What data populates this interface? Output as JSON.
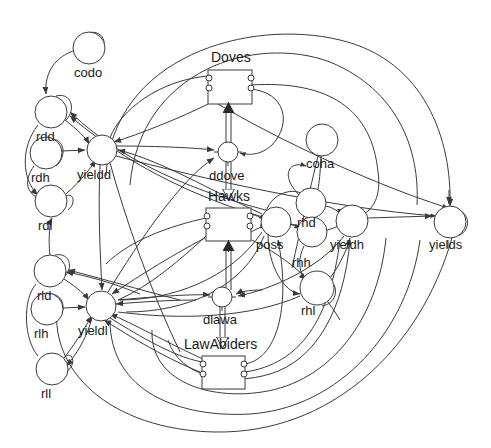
{
  "diagram": {
    "type": "system-dynamics-stock-and-flow",
    "title": "",
    "colors": {
      "stroke": "#3a3a3a",
      "text": "#1a1a1a",
      "background": "#ffffff",
      "flow_fill": "#ffffff"
    },
    "stocks": [
      {
        "id": "Doves",
        "label": "Doves",
        "x": 208,
        "y": 70,
        "w": 44,
        "h": 34,
        "label_x": 211,
        "label_y": 58
      },
      {
        "id": "Hawks",
        "label": "Hawks",
        "x": 206,
        "y": 208,
        "w": 45,
        "h": 33,
        "label_x": 208,
        "label_y": 197
      },
      {
        "id": "LawAbiders",
        "label": "LawAbiders",
        "x": 202,
        "y": 356,
        "w": 43,
        "h": 33,
        "label_x": 184,
        "label_y": 345
      }
    ],
    "flows": [
      {
        "id": "ddove",
        "label": "ddove",
        "cx": 228,
        "cy": 152,
        "r": 10,
        "label_x": 209,
        "label_y": 177
      },
      {
        "id": "dlawa",
        "label": "dlawa",
        "cx": 222,
        "cy": 297,
        "r": 10,
        "label_x": 203,
        "label_y": 321
      }
    ],
    "variables": [
      {
        "id": "codo",
        "label": "codo",
        "cx": 89,
        "cy": 48,
        "r": 16,
        "label_x": 74,
        "label_y": 78
      },
      {
        "id": "rdd",
        "label": "rdd",
        "cx": 51,
        "cy": 112,
        "r": 16,
        "label_x": 36,
        "label_y": 142
      },
      {
        "id": "rdh",
        "label": "rdh",
        "cx": 46,
        "cy": 153,
        "r": 16,
        "label_x": 31,
        "label_y": 183
      },
      {
        "id": "rdl",
        "label": "rdl",
        "cx": 51,
        "cy": 201,
        "r": 16,
        "label_x": 38,
        "label_y": 231
      },
      {
        "id": "yieldd",
        "label": "yieldd",
        "cx": 102,
        "cy": 150,
        "r": 15,
        "label_x": 79,
        "label_y": 180
      },
      {
        "id": "rld",
        "label": "rld",
        "cx": 50,
        "cy": 271,
        "r": 16,
        "label_x": 37,
        "label_y": 301
      },
      {
        "id": "rlh",
        "label": "rlh",
        "cx": 47,
        "cy": 309,
        "r": 16,
        "label_x": 34,
        "label_y": 339
      },
      {
        "id": "rll",
        "label": "rll",
        "cx": 52,
        "cy": 369,
        "r": 16,
        "label_x": 41,
        "label_y": 399
      },
      {
        "id": "yieldl",
        "label": "yieldl",
        "cx": 101,
        "cy": 306,
        "r": 15,
        "label_x": 80,
        "label_y": 336
      },
      {
        "id": "coha",
        "label": "coha",
        "cx": 322,
        "cy": 140,
        "r": 16,
        "label_x": 306,
        "label_y": 168
      },
      {
        "id": "poss",
        "label": "poss",
        "cx": 276,
        "cy": 222,
        "r": 15,
        "label_x": 257,
        "label_y": 249
      },
      {
        "id": "rhd",
        "label": "rhd",
        "cx": 311,
        "cy": 203,
        "r": 15,
        "label_x": 297,
        "label_y": 228
      },
      {
        "id": "rhh",
        "label": "rhh",
        "cx": 312,
        "cy": 232,
        "r": 15,
        "label_x": 292,
        "label_y": 268
      },
      {
        "id": "rhl",
        "label": "rhl",
        "cx": 317,
        "cy": 288,
        "r": 17,
        "label_x": 301,
        "label_y": 316
      },
      {
        "id": "yieldh",
        "label": "yieldh",
        "cx": 352,
        "cy": 221,
        "r": 16,
        "label_x": 331,
        "label_y": 250
      },
      {
        "id": "yields",
        "label": "yields",
        "cx": 450,
        "cy": 222,
        "r": 16,
        "label_x": 430,
        "label_y": 250
      }
    ],
    "labels": [
      "Doves",
      "Hawks",
      "LawAbiders",
      "ddove",
      "dlawa",
      "codo",
      "rdd",
      "rdh",
      "rdl",
      "yieldd",
      "rld",
      "rlh",
      "rll",
      "yieldl",
      "coha",
      "poss",
      "rhd",
      "rhh",
      "rhl",
      "yieldh",
      "yields"
    ]
  }
}
